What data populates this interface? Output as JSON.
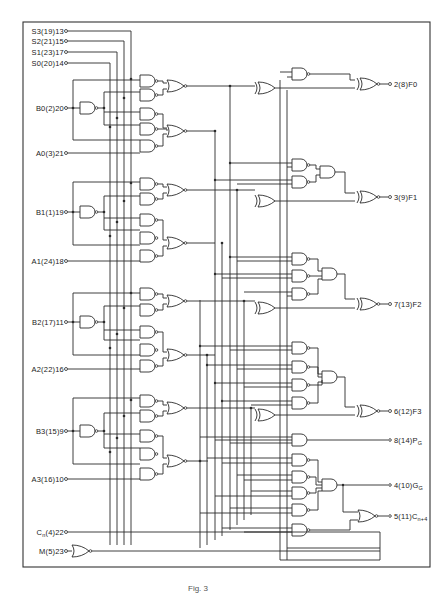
{
  "diagram": {
    "type": "logic-schematic",
    "inputs": [
      {
        "id": "s3",
        "label": "S3(19)13"
      },
      {
        "id": "s2",
        "label": "S2(21)15"
      },
      {
        "id": "s1",
        "label": "S1(23)17"
      },
      {
        "id": "s0",
        "label": "S0(20)14"
      },
      {
        "id": "b0",
        "label": "B0(2)20"
      },
      {
        "id": "a0",
        "label": "A0(3)21"
      },
      {
        "id": "b1",
        "label": "B1(1)19"
      },
      {
        "id": "a1",
        "label": "A1(24)18"
      },
      {
        "id": "b2",
        "label": "B2(17)11"
      },
      {
        "id": "a2",
        "label": "A2(22)16"
      },
      {
        "id": "b3",
        "label": "B3(15)9"
      },
      {
        "id": "a3",
        "label": "A3(16)10"
      },
      {
        "id": "cn",
        "label_main": "C",
        "label_sub": "n",
        "label_rest": "(4)22"
      },
      {
        "id": "m",
        "label": "M(5)23"
      }
    ],
    "outputs": [
      {
        "id": "f0",
        "label": "2(8)F0"
      },
      {
        "id": "f1",
        "label": "3(9)F1"
      },
      {
        "id": "f2",
        "label": "7(13)F2"
      },
      {
        "id": "f3",
        "label": "6(12)F3"
      },
      {
        "id": "pg",
        "label_main": "8(14)P",
        "label_sub": "G"
      },
      {
        "id": "gg",
        "label_main": "4(10)G",
        "label_sub": "G"
      },
      {
        "id": "cn4",
        "label_main": "5(11)C",
        "label_sub": "n+4"
      }
    ],
    "caption": "Fig. 3"
  }
}
